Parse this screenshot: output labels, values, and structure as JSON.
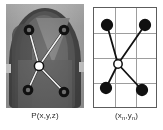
{
  "figure": {
    "width": 163,
    "height": 130,
    "background_color": "#ffffff"
  },
  "left_panel": {
    "name": "world-coordinate-photo",
    "caption": "P(x,y,z)",
    "description": "grayscale photograph of a rounded dome-shaped object with five overlaid landmark markers connected by light lines",
    "marker_style": {
      "center_fill": "#111111",
      "outer_fill": "#ffffff",
      "ring_color": "#111111",
      "link_color": "#f2f2f2"
    },
    "landmarks": [
      {
        "id": "top-left",
        "cx": 23,
        "cy": 26,
        "r": 4.6,
        "filled": false
      },
      {
        "id": "top-right",
        "cx": 58,
        "cy": 26,
        "r": 4.6,
        "filled": false
      },
      {
        "id": "center",
        "cx": 33,
        "cy": 62,
        "r": 4.6,
        "filled": true
      },
      {
        "id": "bottom-left",
        "cx": 22,
        "cy": 86,
        "r": 4.6,
        "filled": false
      },
      {
        "id": "bottom-right",
        "cx": 58,
        "cy": 88,
        "r": 4.6,
        "filled": false
      }
    ],
    "links": [
      {
        "from": "center",
        "to": "top-left"
      },
      {
        "from": "center",
        "to": "top-right"
      },
      {
        "from": "center",
        "to": "bottom-left"
      },
      {
        "from": "center",
        "to": "bottom-right"
      }
    ]
  },
  "right_panel": {
    "name": "image-coordinate-grid",
    "caption_text": "(x",
    "caption_sub1": "n",
    "caption_mid": ",y",
    "caption_sub2": "n",
    "caption_end": ")",
    "caption_full": "(xn,yn)",
    "grid": {
      "columns": 3,
      "rows": 4,
      "border_color": "#5c5c5c",
      "line_color": "#9d9d9d",
      "v_lines": [
        21,
        42
      ],
      "h_lines": [
        25,
        50,
        75
      ]
    },
    "marker_style": {
      "center_fill": "#ffffff",
      "outer_fill": "#111111",
      "ring_color": "#111111",
      "link_color": "#111111"
    },
    "landmarks": [
      {
        "id": "top-left",
        "cx": 13,
        "cy": 17,
        "r": 5.4,
        "filled": true
      },
      {
        "id": "top-right",
        "cx": 51,
        "cy": 17,
        "r": 5.4,
        "filled": true
      },
      {
        "id": "center",
        "cx": 24,
        "cy": 56,
        "r": 4.2,
        "filled": false
      },
      {
        "id": "bottom-left",
        "cx": 12,
        "cy": 80,
        "r": 5.4,
        "filled": true
      },
      {
        "id": "bottom-right",
        "cx": 48,
        "cy": 82,
        "r": 5.4,
        "filled": true
      }
    ],
    "links": [
      {
        "from": "center",
        "to": "top-left"
      },
      {
        "from": "center",
        "to": "top-right"
      },
      {
        "from": "center",
        "to": "bottom-left"
      },
      {
        "from": "center",
        "to": "bottom-right"
      }
    ]
  }
}
